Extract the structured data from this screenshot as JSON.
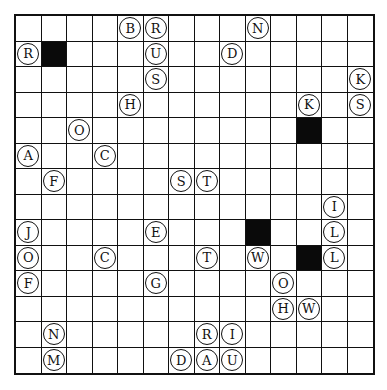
{
  "puzzle": {
    "rows": 14,
    "cols": 14,
    "colors": {
      "line": "#111111",
      "black_cell": "#0a0a0a",
      "cell": "#ffffff"
    },
    "black_cells": [
      [
        1,
        1
      ],
      [
        4,
        11
      ],
      [
        8,
        9
      ],
      [
        9,
        11
      ]
    ],
    "letters": [
      {
        "r": 0,
        "c": 4,
        "ch": "B"
      },
      {
        "r": 0,
        "c": 5,
        "ch": "R"
      },
      {
        "r": 0,
        "c": 9,
        "ch": "N"
      },
      {
        "r": 1,
        "c": 0,
        "ch": "R"
      },
      {
        "r": 1,
        "c": 5,
        "ch": "U"
      },
      {
        "r": 1,
        "c": 8,
        "ch": "D"
      },
      {
        "r": 2,
        "c": 5,
        "ch": "S"
      },
      {
        "r": 2,
        "c": 13,
        "ch": "K"
      },
      {
        "r": 3,
        "c": 4,
        "ch": "H"
      },
      {
        "r": 3,
        "c": 11,
        "ch": "K"
      },
      {
        "r": 3,
        "c": 13,
        "ch": "S"
      },
      {
        "r": 4,
        "c": 2,
        "ch": "O"
      },
      {
        "r": 5,
        "c": 0,
        "ch": "A"
      },
      {
        "r": 5,
        "c": 3,
        "ch": "C"
      },
      {
        "r": 6,
        "c": 1,
        "ch": "F"
      },
      {
        "r": 6,
        "c": 6,
        "ch": "S"
      },
      {
        "r": 6,
        "c": 7,
        "ch": "T"
      },
      {
        "r": 7,
        "c": 12,
        "ch": "I"
      },
      {
        "r": 8,
        "c": 0,
        "ch": "J"
      },
      {
        "r": 8,
        "c": 5,
        "ch": "E"
      },
      {
        "r": 8,
        "c": 12,
        "ch": "L"
      },
      {
        "r": 9,
        "c": 0,
        "ch": "O"
      },
      {
        "r": 9,
        "c": 3,
        "ch": "C"
      },
      {
        "r": 9,
        "c": 7,
        "ch": "T"
      },
      {
        "r": 9,
        "c": 9,
        "ch": "W"
      },
      {
        "r": 9,
        "c": 12,
        "ch": "L"
      },
      {
        "r": 10,
        "c": 0,
        "ch": "F"
      },
      {
        "r": 10,
        "c": 5,
        "ch": "G"
      },
      {
        "r": 10,
        "c": 10,
        "ch": "O"
      },
      {
        "r": 11,
        "c": 10,
        "ch": "H"
      },
      {
        "r": 11,
        "c": 11,
        "ch": "W"
      },
      {
        "r": 12,
        "c": 1,
        "ch": "N"
      },
      {
        "r": 12,
        "c": 7,
        "ch": "R"
      },
      {
        "r": 12,
        "c": 8,
        "ch": "I"
      },
      {
        "r": 13,
        "c": 1,
        "ch": "M"
      },
      {
        "r": 13,
        "c": 6,
        "ch": "D"
      },
      {
        "r": 13,
        "c": 7,
        "ch": "A"
      },
      {
        "r": 13,
        "c": 8,
        "ch": "U"
      }
    ]
  }
}
